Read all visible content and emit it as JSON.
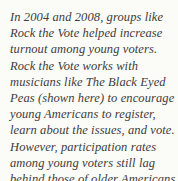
{
  "caption": {
    "full_text": "In 2004 and 2008, groups like Rock the Vote helped increase turnout among young voters. Rock the Vote works with musicians like The Black Eyed Peas (shown here) to encourage young Americans to register, learn about the issues, and vote. However, participation rates among young voters still lag behind those of older Americans.",
    "lines": [
      "In 2004 and 2008, groups like",
      "Rock the Vote helped increase",
      "turnout among young voters.",
      "Rock the Vote works with",
      "musicians like The Black Eyed",
      "Peas (shown here) to encourage",
      "young Americans to register,",
      "learn about the issues, and vote.",
      "However, participation rates",
      "among young voters still lag",
      "behind those of older Americans."
    ],
    "colors": {
      "background": "#fbfbf8",
      "text": "#3e3b3b"
    }
  }
}
